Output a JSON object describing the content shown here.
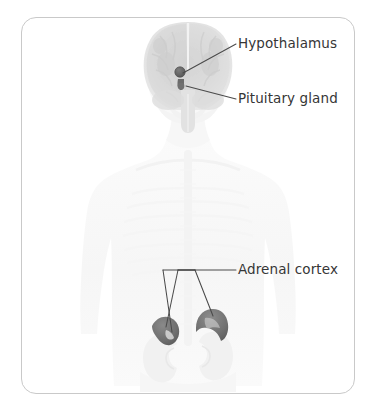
{
  "figure": {
    "kind": "anatomical-illustration",
    "background_color": "#ffffff",
    "frame": {
      "border_color": "#c9c9c9",
      "corner_radius_px": 15,
      "x": 21,
      "y": 17,
      "width": 334,
      "height": 377
    }
  },
  "palette": {
    "label_text": "#363636",
    "leader_line": "#4a4a4a",
    "organ_highlight": "#7a7a7a",
    "organ_highlight_dark": "#616161",
    "brain_tissue": "#d9d9d9",
    "body_silhouette": "#f4f4f4",
    "kidney": "#f0f0f0"
  },
  "labels": [
    {
      "id": "hypothalamus",
      "text": "Hypothalamus",
      "x": 238,
      "y": 36,
      "leader_from": [
        236,
        44
      ],
      "leader_to": [
        183,
        73
      ]
    },
    {
      "id": "pituitary",
      "text": "Pituitary gland",
      "x": 238,
      "y": 91,
      "leader_from": [
        236,
        99
      ],
      "leader_to": [
        185,
        86
      ]
    },
    {
      "id": "adrenal_cortex",
      "text": "Adrenal cortex",
      "x": 238,
      "y": 262,
      "leader_from": [
        236,
        270
      ],
      "leader_to": [
        166,
        327
      ]
    }
  ],
  "structures": [
    {
      "id": "brain",
      "name": "brain",
      "description": "coronal-view brain, faint gray",
      "center": [
        187,
        66
      ],
      "width": 92,
      "height": 90
    },
    {
      "id": "hypothalamus-marker",
      "name": "hypothalamus",
      "description": "small dark gray nucleus marker",
      "center": [
        180,
        72
      ],
      "radius": 4.6
    },
    {
      "id": "pituitary-marker",
      "name": "pituitary-gland",
      "description": "small dark gray gland marker below hypothalamus",
      "center": [
        181,
        85
      ],
      "radius": 3.2
    },
    {
      "id": "adrenal-left",
      "name": "adrenal-gland-left",
      "description": "dark gray cap atop left kidney",
      "center": [
        163,
        329
      ]
    },
    {
      "id": "adrenal-right",
      "name": "adrenal-gland-right",
      "description": "dark gray crescent cap atop right kidney",
      "center": [
        209,
        323
      ]
    },
    {
      "id": "kidney-left",
      "name": "kidney-left",
      "description": "faint bean-shaped kidney",
      "center": [
        166,
        352
      ]
    },
    {
      "id": "kidney-right",
      "name": "kidney-right",
      "description": "faint bean-shaped kidney",
      "center": [
        213,
        350
      ]
    },
    {
      "id": "torso",
      "name": "body-silhouette",
      "description": "faint head, neck, shoulders, torso and arms",
      "center": [
        188,
        250
      ]
    }
  ]
}
